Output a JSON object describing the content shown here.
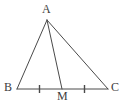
{
  "diagram": {
    "kind": "triangle-with-median",
    "stroke_color": "#4a4a4a",
    "label_color": "#3d3d3d",
    "background_color": "#ffffff",
    "stroke_width": 1,
    "vertices": [
      {
        "name": "A",
        "label": "A",
        "x": 47,
        "y": 20
      },
      {
        "name": "B",
        "label": "B",
        "x": 17,
        "y": 89
      },
      {
        "name": "C",
        "label": "C",
        "x": 108,
        "y": 89
      },
      {
        "name": "M",
        "label": "M",
        "x": 62,
        "y": 89
      }
    ],
    "segments": [
      {
        "name": "AB",
        "x1": 47,
        "y1": 20,
        "x2": 17,
        "y2": 89
      },
      {
        "name": "AC",
        "x1": 47,
        "y1": 20,
        "x2": 108,
        "y2": 89
      },
      {
        "name": "AM",
        "x1": 47,
        "y1": 20,
        "x2": 62,
        "y2": 89
      },
      {
        "name": "BC",
        "x1": 17,
        "y1": 89,
        "x2": 108,
        "y2": 89
      }
    ],
    "tick_marks": [
      {
        "name": "tick-BM",
        "x": 39.5,
        "y1": 85,
        "y2": 93
      },
      {
        "name": "tick-MC",
        "x": 84.5,
        "y1": 85,
        "y2": 93
      }
    ]
  }
}
